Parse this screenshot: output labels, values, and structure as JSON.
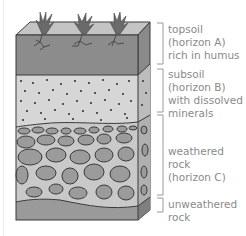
{
  "layers": [
    {
      "id": "topsoil",
      "label": "topsoil\n(horizon A)\nrich in humus",
      "color": "#8c8c8c"
    },
    {
      "id": "subsoil",
      "label": "subsoil\n(horizon B)\nwith dissolved\nminerals",
      "color": "#d6d6d6"
    },
    {
      "id": "weathered-rock",
      "label": "weathered rock\n(horizon C)",
      "color": "#bdbdbd"
    },
    {
      "id": "unweathered-rock",
      "label": "unweathered\nrock",
      "color": "#9a9a9a"
    }
  ],
  "colors": {
    "outline": "#3a3a3a",
    "top_face": "#c4c4c4",
    "side_face": "#7a7a7a",
    "plant": "#6a6a6a",
    "bracket": "#9a9a9a",
    "label_text": "#8a8a8a"
  }
}
